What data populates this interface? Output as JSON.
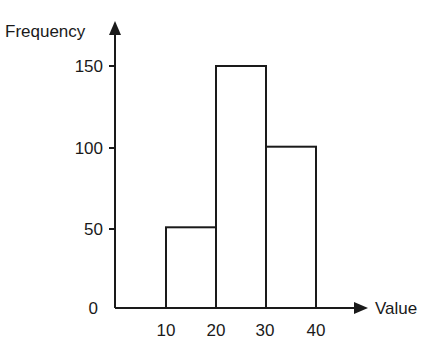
{
  "chart_data": {
    "type": "bar",
    "subtype": "histogram",
    "title": "",
    "xlabel": "Value",
    "ylabel": "Frequency",
    "bins": [
      [
        10,
        20
      ],
      [
        20,
        30
      ],
      [
        30,
        40
      ]
    ],
    "categories": [
      "10-20",
      "20-30",
      "30-40"
    ],
    "values": [
      50,
      150,
      100
    ],
    "x_ticks": [
      "10",
      "20",
      "30",
      "40"
    ],
    "y_ticks": [
      "0",
      "50",
      "100",
      "150"
    ],
    "xlim": [
      0,
      50
    ],
    "ylim": [
      0,
      175
    ],
    "grid": false,
    "legend": null
  },
  "axes": {
    "x_label": "Value",
    "y_label": "Frequency",
    "origin_label": "0",
    "y_tick_labels": [
      "50",
      "100",
      "150"
    ],
    "x_tick_labels": [
      "10",
      "20",
      "30",
      "40"
    ]
  },
  "colors": {
    "line": "#1a1a1a",
    "bar_fill": "#ffffff",
    "background": "#ffffff"
  }
}
